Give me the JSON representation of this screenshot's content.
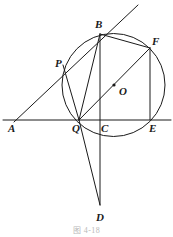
{
  "figure": {
    "caption": "图 4-18",
    "stroke_color": "#1a1a1a",
    "background_color": "#ffffff",
    "width": 173,
    "height": 237
  },
  "points": [
    {
      "id": "A",
      "label": "A",
      "x": 15,
      "y": 122,
      "label_x": 8,
      "label_y": 123,
      "dot": false
    },
    {
      "id": "P",
      "label": "P",
      "x": 63,
      "y": 65,
      "label_x": 55,
      "label_y": 58,
      "dot": false
    },
    {
      "id": "B",
      "label": "B",
      "x": 100,
      "y": 34,
      "label_x": 95,
      "label_y": 19,
      "dot": false
    },
    {
      "id": "F",
      "label": "F",
      "x": 150,
      "y": 48,
      "label_x": 152,
      "label_y": 36,
      "dot": false
    },
    {
      "id": "O",
      "label": "O",
      "x": 114,
      "y": 85,
      "label_x": 119,
      "label_y": 86,
      "dot": true
    },
    {
      "id": "Q",
      "label": "Q",
      "x": 79,
      "y": 120,
      "label_x": 72,
      "label_y": 123,
      "dot": false
    },
    {
      "id": "C",
      "label": "C",
      "x": 100,
      "y": 120,
      "label_x": 101,
      "label_y": 123,
      "dot": false
    },
    {
      "id": "E",
      "label": "E",
      "x": 150,
      "y": 120,
      "label_x": 149,
      "label_y": 123,
      "dot": false
    },
    {
      "id": "D",
      "label": "D",
      "x": 100,
      "y": 205,
      "label_x": 96,
      "label_y": 212,
      "dot": false
    }
  ],
  "circle": {
    "name": "circumscribed-circle",
    "cx": 113.5,
    "cy": 85,
    "r": 51.5
  },
  "segments": [
    {
      "name": "ray-A-through-P-B",
      "x1": 14,
      "y1": 122,
      "x2": 138,
      "y2": 5
    },
    {
      "name": "line-A-Q-C-E-right",
      "x1": 3,
      "y1": 120,
      "x2": 171,
      "y2": 120
    },
    {
      "name": "segment-B-Q",
      "x1": 100,
      "y1": 34,
      "x2": 79,
      "y2": 120
    },
    {
      "name": "segment-P-Q",
      "x1": 63,
      "y1": 65,
      "x2": 79,
      "y2": 120
    },
    {
      "name": "segment-B-C-D-vertical",
      "x1": 100,
      "y1": 34,
      "x2": 100,
      "y2": 205
    },
    {
      "name": "segment-Q-D",
      "x1": 79,
      "y1": 120,
      "x2": 100,
      "y2": 205
    },
    {
      "name": "diameter-Q-O-F",
      "x1": 79,
      "y1": 120,
      "x2": 150,
      "y2": 48
    },
    {
      "name": "chord-B-F",
      "x1": 100,
      "y1": 34,
      "x2": 150,
      "y2": 48
    },
    {
      "name": "segment-F-E",
      "x1": 150,
      "y1": 48,
      "x2": 150,
      "y2": 120
    }
  ]
}
